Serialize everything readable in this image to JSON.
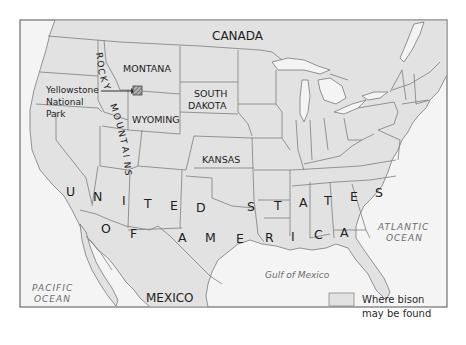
{
  "map": {
    "title": "Where bison may be found",
    "colors": {
      "background": "#ffffff",
      "ocean": "#f4f4f4",
      "land_bison_range": "#e2e2e2",
      "border": "#7a7a7a",
      "frame": "#6e6e6e",
      "text": "#1d1d1d",
      "ocean_text": "#6d6d6d"
    },
    "labels": {
      "canada": "CANADA",
      "mexico": "MEXICO",
      "montana": "MONTANA",
      "south_dakota_line1": "SOUTH",
      "south_dakota_line2": "DAKOTA",
      "wyoming": "WYOMING",
      "kansas": "KANSAS",
      "yellowstone_line1": "Yellowstone",
      "yellowstone_line2": "National",
      "yellowstone_line3": "Park",
      "rocky_mountains": "ROCKY MOUNTAINS",
      "pacific_line1": "PACIFIC",
      "pacific_line2": "OCEAN",
      "atlantic_line1": "ATLANTIC",
      "atlantic_line2": "OCEAN",
      "gulf": "Gulf of Mexico"
    },
    "spaced_letters": {
      "united_states": [
        "U",
        "N",
        "I",
        "T",
        "E",
        "D",
        "S",
        "T",
        "A",
        "T",
        "E",
        "S"
      ],
      "of_america": [
        "O",
        "F",
        "A",
        "M",
        "E",
        "R",
        "I",
        "C",
        "A"
      ]
    },
    "rocky_letters": [
      "R",
      "O",
      "C",
      "K",
      "Y",
      "M",
      "O",
      "U",
      "N",
      "T",
      "A",
      "I",
      "N",
      "S"
    ],
    "legend": {
      "swatch_icon": "legend-swatch",
      "line1": "Where bison",
      "line2": "may be found"
    },
    "marker": {
      "name": "Yellowstone National Park",
      "icon": "hatched-square"
    }
  }
}
